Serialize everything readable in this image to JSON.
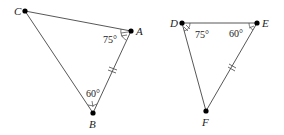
{
  "triangles": [
    {
      "name": "ABC",
      "vertices": {
        "C": "C",
        "A": "A",
        "B": "B"
      },
      "angles": {
        "A": "75°",
        "B": "60°"
      }
    },
    {
      "name": "DEF",
      "vertices": {
        "D": "D",
        "E": "E",
        "F": "F"
      },
      "angles": {
        "D": "75°",
        "E": "60°"
      }
    }
  ],
  "colors": {
    "line": "#333333",
    "point": "#000000"
  }
}
